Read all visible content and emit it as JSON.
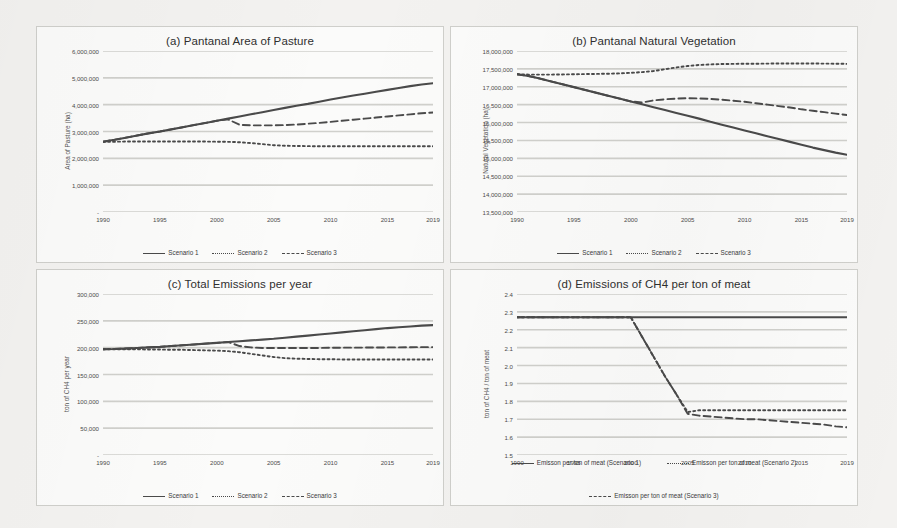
{
  "figure": {
    "background": "#f3f2f0",
    "panel_background": "#fbfbfa",
    "line_color": "#4a4a4a",
    "grid_color": "#d0d0cc"
  },
  "chart_data": [
    {
      "id": "a",
      "type": "line",
      "title": "(a) Pantanal Area of Pasture",
      "xlabel": "",
      "ylabel": "Area of Pasture (ha)",
      "x": [
        1990,
        1991,
        1992,
        1993,
        1994,
        1995,
        1996,
        1997,
        1998,
        1999,
        2000,
        2001,
        2002,
        2003,
        2004,
        2005,
        2006,
        2007,
        2008,
        2009,
        2010,
        2011,
        2012,
        2013,
        2014,
        2015,
        2016,
        2017,
        2018,
        2019
      ],
      "xticks": [
        1990,
        1995,
        2000,
        2005,
        2010,
        2015,
        2019
      ],
      "xticklabels": [
        "1990",
        "1995",
        "2000",
        "2005",
        "2010",
        "2015",
        "2019"
      ],
      "yticks": [
        0,
        1000000,
        2000000,
        3000000,
        4000000,
        5000000,
        6000000
      ],
      "yticklabels": [
        "-",
        "1,000,000",
        "2,000,000",
        "3,000,000",
        "4,000,000",
        "5,000,000",
        "6,000,000"
      ],
      "ylim": [
        0,
        6000000
      ],
      "xlim": [
        1990,
        2019
      ],
      "grid": true,
      "legend_position": "bottom",
      "series": [
        {
          "name": "Scenario 1",
          "style": "solid",
          "values": [
            2620000,
            2690000,
            2770000,
            2850000,
            2930000,
            3000000,
            3080000,
            3160000,
            3240000,
            3320000,
            3400000,
            3480000,
            3560000,
            3640000,
            3720000,
            3800000,
            3880000,
            3960000,
            4030000,
            4110000,
            4190000,
            4270000,
            4340000,
            4410000,
            4480000,
            4550000,
            4620000,
            4690000,
            4750000,
            4800000
          ]
        },
        {
          "name": "Scenario 2",
          "style": "dotted",
          "values": [
            2620000,
            2620000,
            2625000,
            2630000,
            2630000,
            2630000,
            2630000,
            2630000,
            2630000,
            2625000,
            2620000,
            2615000,
            2600000,
            2570000,
            2530000,
            2490000,
            2470000,
            2460000,
            2455000,
            2450000,
            2450000,
            2450000,
            2450000,
            2450000,
            2450000,
            2450000,
            2450000,
            2450000,
            2450000,
            2450000
          ]
        },
        {
          "name": "Scenario 3",
          "style": "dashed",
          "values": [
            2620000,
            2690000,
            2770000,
            2850000,
            2930000,
            3000000,
            3080000,
            3160000,
            3240000,
            3320000,
            3400000,
            3450000,
            3250000,
            3230000,
            3230000,
            3230000,
            3240000,
            3260000,
            3290000,
            3320000,
            3360000,
            3400000,
            3440000,
            3480000,
            3520000,
            3560000,
            3600000,
            3640000,
            3680000,
            3710000
          ]
        }
      ]
    },
    {
      "id": "b",
      "type": "line",
      "title": "(b) Pantanal Natural Vegetation",
      "xlabel": "",
      "ylabel": "Natural Vegetation (ha)",
      "x": [
        1990,
        1991,
        1992,
        1993,
        1994,
        1995,
        1996,
        1997,
        1998,
        1999,
        2000,
        2001,
        2002,
        2003,
        2004,
        2005,
        2006,
        2007,
        2008,
        2009,
        2010,
        2011,
        2012,
        2013,
        2014,
        2015,
        2016,
        2017,
        2018,
        2019
      ],
      "xticks": [
        1990,
        1995,
        2000,
        2005,
        2010,
        2015,
        2019
      ],
      "xticklabels": [
        "1990",
        "1995",
        "2000",
        "2005",
        "2010",
        "2015",
        "2019"
      ],
      "yticks": [
        13500000,
        14000000,
        14500000,
        15000000,
        15500000,
        16000000,
        16500000,
        17000000,
        17500000,
        18000000
      ],
      "yticklabels": [
        "13,500,000",
        "14,000,000",
        "14,500,000",
        "15,000,000",
        "15,500,000",
        "16,000,000",
        "16,500,000",
        "17,000,000",
        "17,500,000",
        "18,000,000"
      ],
      "ylim": [
        13500000,
        18000000
      ],
      "xlim": [
        1990,
        2019
      ],
      "grid": true,
      "legend_position": "bottom",
      "series": [
        {
          "name": "Scenario 1",
          "style": "solid",
          "values": [
            17350000,
            17300000,
            17230000,
            17150000,
            17070000,
            16990000,
            16910000,
            16830000,
            16750000,
            16670000,
            16590000,
            16510000,
            16430000,
            16350000,
            16270000,
            16190000,
            16110000,
            16020000,
            15940000,
            15860000,
            15780000,
            15700000,
            15620000,
            15540000,
            15460000,
            15380000,
            15300000,
            15230000,
            15160000,
            15100000
          ]
        },
        {
          "name": "Scenario 2",
          "style": "dotted",
          "values": [
            17350000,
            17340000,
            17340000,
            17340000,
            17345000,
            17350000,
            17355000,
            17360000,
            17365000,
            17375000,
            17390000,
            17410000,
            17440000,
            17490000,
            17540000,
            17580000,
            17610000,
            17625000,
            17635000,
            17640000,
            17645000,
            17645000,
            17648000,
            17650000,
            17650000,
            17650000,
            17650000,
            17648000,
            17645000,
            17640000
          ]
        },
        {
          "name": "Scenario 3",
          "style": "dashed",
          "values": [
            17350000,
            17300000,
            17230000,
            17150000,
            17070000,
            16990000,
            16910000,
            16830000,
            16750000,
            16670000,
            16590000,
            16560000,
            16620000,
            16650000,
            16670000,
            16680000,
            16675000,
            16660000,
            16640000,
            16610000,
            16580000,
            16540000,
            16500000,
            16460000,
            16420000,
            16370000,
            16330000,
            16290000,
            16250000,
            16210000
          ]
        }
      ]
    },
    {
      "id": "c",
      "type": "line",
      "title": "(c) Total Emissions per year",
      "xlabel": "",
      "ylabel": "ton of CH4 per year",
      "x": [
        1990,
        1991,
        1992,
        1993,
        1994,
        1995,
        1996,
        1997,
        1998,
        1999,
        2000,
        2001,
        2002,
        2003,
        2004,
        2005,
        2006,
        2007,
        2008,
        2009,
        2010,
        2011,
        2012,
        2013,
        2014,
        2015,
        2016,
        2017,
        2018,
        2019
      ],
      "xticks": [
        1990,
        1995,
        2000,
        2005,
        2010,
        2015,
        2019
      ],
      "xticklabels": [
        "1990",
        "1995",
        "2000",
        "2005",
        "2010",
        "2015",
        "2019"
      ],
      "yticks": [
        0,
        50000,
        100000,
        150000,
        200000,
        250000,
        300000
      ],
      "yticklabels": [
        "-",
        "50,000",
        "100,000",
        "150,000",
        "200,000",
        "250,000",
        "300,000"
      ],
      "ylim": [
        0,
        300000
      ],
      "xlim": [
        1990,
        2019
      ],
      "grid": true,
      "legend_position": "bottom",
      "series": [
        {
          "name": "Scenario 1",
          "style": "solid",
          "values": [
            197000,
            197500,
            198500,
            199500,
            200500,
            201500,
            203000,
            204500,
            206000,
            207500,
            209000,
            210500,
            212000,
            213500,
            215000,
            216500,
            218500,
            220500,
            222500,
            224500,
            226500,
            228500,
            230500,
            232500,
            234500,
            236500,
            238000,
            239500,
            241000,
            242000
          ]
        },
        {
          "name": "Scenario 2",
          "style": "dotted",
          "values": [
            197000,
            197000,
            197000,
            197000,
            196500,
            196500,
            196000,
            196000,
            195500,
            195000,
            194500,
            193500,
            191500,
            188500,
            185500,
            182500,
            180500,
            179500,
            179000,
            178500,
            178500,
            178000,
            178000,
            178000,
            178000,
            178000,
            178000,
            178000,
            178000,
            178000
          ]
        },
        {
          "name": "Scenario 3",
          "style": "dashed",
          "values": [
            197000,
            197500,
            198500,
            199500,
            200500,
            201500,
            203000,
            204500,
            206000,
            207500,
            209000,
            210500,
            203000,
            200500,
            199500,
            199500,
            199500,
            199500,
            199500,
            199500,
            199800,
            200000,
            200000,
            200200,
            200300,
            200500,
            200500,
            200800,
            201000,
            201000
          ]
        }
      ]
    },
    {
      "id": "d",
      "type": "line",
      "title": "(d) Emissions of CH4 per ton of meat",
      "xlabel": "",
      "ylabel": "ton of CH4 / ton of meat",
      "x": [
        1990,
        1991,
        1992,
        1993,
        1994,
        1995,
        1996,
        1997,
        1998,
        1999,
        2000,
        2001,
        2002,
        2003,
        2004,
        2005,
        2006,
        2007,
        2008,
        2009,
        2010,
        2011,
        2012,
        2013,
        2014,
        2015,
        2016,
        2017,
        2018,
        2019
      ],
      "xticks": [
        1990,
        1995,
        2000,
        2005,
        2010,
        2015,
        2019
      ],
      "xticklabels": [
        "1990",
        "1995",
        "2000",
        "2005",
        "2010",
        "2015",
        "2019"
      ],
      "yticks": [
        1.5,
        1.6,
        1.7,
        1.8,
        1.9,
        2.0,
        2.1,
        2.2,
        2.3,
        2.4
      ],
      "yticklabels": [
        "1.5",
        "1.6",
        "1.7",
        "1.8",
        "1.9",
        "2.0",
        "2.1",
        "2.2",
        "2.3",
        "2.4"
      ],
      "ylim": [
        1.5,
        2.4
      ],
      "xlim": [
        1990,
        2019
      ],
      "grid": true,
      "legend_position": "bottom",
      "series": [
        {
          "name": "Emisson per ton of meat (Scenario 1)",
          "style": "solid",
          "values": [
            2.27,
            2.27,
            2.27,
            2.27,
            2.27,
            2.27,
            2.27,
            2.27,
            2.27,
            2.27,
            2.27,
            2.27,
            2.27,
            2.27,
            2.27,
            2.27,
            2.27,
            2.27,
            2.27,
            2.27,
            2.27,
            2.27,
            2.27,
            2.27,
            2.27,
            2.27,
            2.27,
            2.27,
            2.27,
            2.27
          ]
        },
        {
          "name": "Emisson per ton of meat (Scenario 2)",
          "style": "dotted",
          "values": [
            2.27,
            2.27,
            2.27,
            2.27,
            2.27,
            2.27,
            2.27,
            2.27,
            2.27,
            2.27,
            2.27,
            2.16,
            2.05,
            1.94,
            1.84,
            1.74,
            1.75,
            1.75,
            1.75,
            1.75,
            1.75,
            1.75,
            1.75,
            1.75,
            1.75,
            1.75,
            1.75,
            1.75,
            1.75,
            1.75
          ]
        },
        {
          "name": "Emisson per ton of meat (Scenario 3)",
          "style": "dashed",
          "values": [
            2.27,
            2.27,
            2.27,
            2.27,
            2.27,
            2.27,
            2.27,
            2.27,
            2.27,
            2.27,
            2.27,
            2.16,
            2.05,
            1.94,
            1.84,
            1.73,
            1.72,
            1.715,
            1.71,
            1.705,
            1.7,
            1.7,
            1.695,
            1.69,
            1.685,
            1.68,
            1.675,
            1.67,
            1.66,
            1.655
          ]
        }
      ]
    }
  ]
}
